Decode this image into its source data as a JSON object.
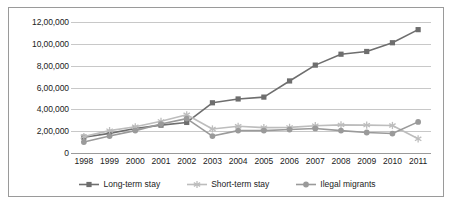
{
  "chart_data": {
    "type": "line",
    "title": "",
    "xlabel": "",
    "ylabel": "",
    "categories": [
      "1998",
      "1999",
      "2000",
      "2001",
      "2002",
      "2003",
      "2004",
      "2005",
      "2006",
      "2007",
      "2008",
      "2009",
      "2010",
      "2011"
    ],
    "ylim": [
      0,
      1200000
    ],
    "ytick_values": [
      0,
      200000,
      400000,
      600000,
      800000,
      1000000,
      1200000
    ],
    "ytick_labels": [
      "0",
      "2,00,000",
      "4,00,000",
      "6,00,000",
      "8,00,000",
      "10,00,000",
      "12,00,000"
    ],
    "grid": true,
    "legend_position": "bottom",
    "series": [
      {
        "name": "Long-term stay",
        "color": "#6e6e6e",
        "marker": "square",
        "values": [
          145000,
          180000,
          225000,
          255000,
          280000,
          460000,
          495000,
          512000,
          660000,
          805000,
          905000,
          930000,
          1010000,
          1130000
        ]
      },
      {
        "name": "Short-term stay",
        "color": "#bdbdbd",
        "marker": "asterisk",
        "values": [
          150000,
          205000,
          240000,
          290000,
          350000,
          220000,
          245000,
          232000,
          235000,
          250000,
          258000,
          255000,
          252000,
          130000
        ]
      },
      {
        "name": "Ilegal migrants",
        "color": "#9a9a9a",
        "marker": "circle",
        "values": [
          100000,
          155000,
          205000,
          265000,
          315000,
          155000,
          205000,
          205000,
          215000,
          225000,
          205000,
          188000,
          178000,
          285000
        ]
      }
    ]
  },
  "legend": {
    "items": [
      {
        "label": "Long-term stay"
      },
      {
        "label": "Short-term stay"
      },
      {
        "label": "Ilegal migrants"
      }
    ]
  }
}
